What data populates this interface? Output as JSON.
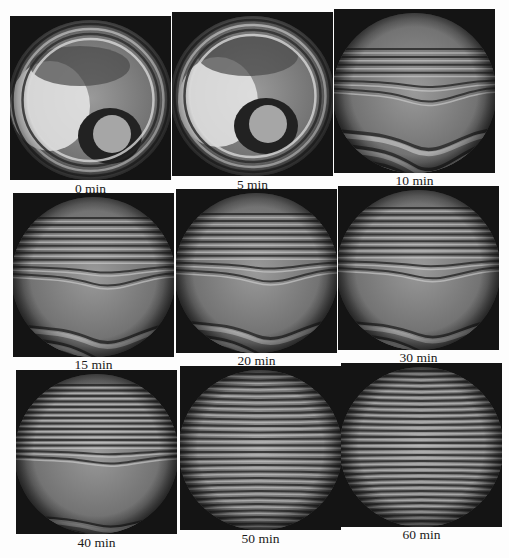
{
  "figure": {
    "panels": [
      {
        "label": "0 min",
        "pattern": "rings",
        "x": 10,
        "y": 16,
        "label_y": 181
      },
      {
        "label": "5 min",
        "pattern": "rings2",
        "x": 172,
        "y": 12,
        "label_y": 177
      },
      {
        "label": "10 min",
        "pattern": "wave",
        "x": 334,
        "y": 9,
        "label_y": 173
      },
      {
        "label": "15 min",
        "pattern": "wave2",
        "x": 13,
        "y": 193,
        "label_y": 357
      },
      {
        "label": "20 min",
        "pattern": "wave2",
        "x": 176,
        "y": 189,
        "label_y": 353
      },
      {
        "label": "30 min",
        "pattern": "wave3",
        "x": 338,
        "y": 186,
        "label_y": 350
      },
      {
        "label": "40 min",
        "pattern": "wave4",
        "x": 16,
        "y": 370,
        "label_y": 535
      },
      {
        "label": "50 min",
        "pattern": "straight",
        "x": 180,
        "y": 366,
        "label_y": 531
      },
      {
        "label": "60 min",
        "pattern": "straight2",
        "x": 341,
        "y": 363,
        "label_y": 527
      }
    ]
  }
}
